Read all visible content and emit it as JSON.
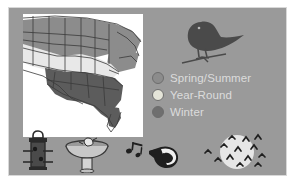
{
  "poster": {
    "background_color": "#ffffff",
    "panel_color": "#9a9a9a",
    "panel_border_color": "#d8d8d8",
    "title": "Bird Range Map"
  },
  "map": {
    "name": "united-states-range-map",
    "background_color": "#ffffff",
    "outline_color": "#3a3a3a",
    "regions": [
      {
        "label": "Spring/Summer",
        "color": "#8c8c8c"
      },
      {
        "label": "Year-Round",
        "color": "#e8e8e8"
      },
      {
        "label": "Winter",
        "color": "#5c5c5c"
      }
    ]
  },
  "bird": {
    "name": "perched-bird-silhouette",
    "color": "#4a4a4a"
  },
  "legend": {
    "text_color": "#dcdcdc",
    "items": [
      {
        "label": "Spring/Summer",
        "color": "#8c8c8c",
        "icon": "circle-swatch-icon"
      },
      {
        "label": "Year-Round",
        "color": "#e4e4d8",
        "icon": "circle-swatch-icon"
      },
      {
        "label": "Winter",
        "color": "#6f6f6f",
        "icon": "circle-swatch-icon"
      }
    ]
  },
  "icons": [
    {
      "name": "bird-feeder-icon",
      "label": "Bird Feeder",
      "color": "#2b2b2b"
    },
    {
      "name": "birdbath-icon",
      "label": "Birdbath",
      "color": "#d8d8d8"
    },
    {
      "name": "singing-bird-icon",
      "label": "Singing Bird",
      "color": "#1f1f1f"
    },
    {
      "name": "migrating-birds-moon-icon",
      "label": "Migration",
      "color": "#1f1f1f",
      "moon_color": "#e6e6e6"
    }
  ]
}
